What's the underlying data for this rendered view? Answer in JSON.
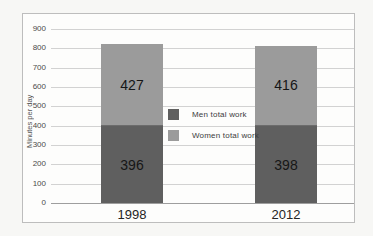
{
  "figure": {
    "page_background": "#f7f7f5",
    "chart_background": "#fdfdfc",
    "border_color": "#bdbdbd",
    "gridline_color": "#d2d2d2",
    "baseline_color": "#9e9e9e"
  },
  "chart_data": {
    "type": "bar",
    "stacked": true,
    "title": "",
    "xlabel": "",
    "ylabel": "Minutes per day",
    "categories": [
      "1998",
      "2012"
    ],
    "series": [
      {
        "name": "Men total work",
        "color": "#5f5f5f",
        "values": [
          396,
          398
        ]
      },
      {
        "name": "Women total work",
        "color": "#9b9b9b",
        "values": [
          427,
          416
        ]
      }
    ],
    "ylim": [
      0,
      900
    ],
    "yticks": [
      0,
      100,
      200,
      300,
      400,
      500,
      600,
      700,
      800,
      900
    ],
    "grid": true,
    "data_labels": true,
    "legend": {
      "position": "inside-plot-center-right",
      "entries": [
        "Men total work",
        "Women total work"
      ]
    }
  }
}
